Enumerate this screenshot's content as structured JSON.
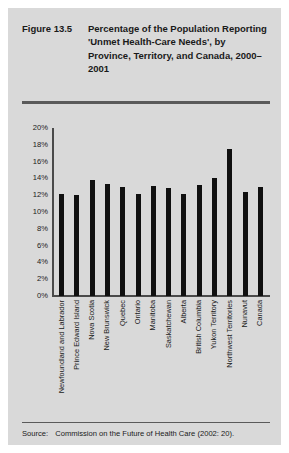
{
  "figure": {
    "number": "Figure 13.5",
    "title": "Percentage of the Population Reporting 'Unmet Health-Care Needs', by Province, Territory, and Canada, 2000–2001",
    "source_label": "Source:",
    "source_text": "Commission on the Future of Health Care (2002: 20)."
  },
  "colors": {
    "panel_background": "#d9d9d9",
    "bar": "#101010",
    "axis": "#4a4a4a",
    "rule": "#5a5a5a",
    "text": "#1a1a1a"
  },
  "chart_data": {
    "type": "bar",
    "title": "Percentage of the Population Reporting 'Unmet Health-Care Needs', by Province, Territory, and Canada, 2000–2001",
    "xlabel": "",
    "ylabel": "",
    "ylim": [
      0,
      20
    ],
    "ytick_labels": [
      "20%",
      "18%",
      "16%",
      "14%",
      "12%",
      "10%",
      "8%",
      "6%",
      "4%",
      "2%",
      "0%"
    ],
    "ytick_values": [
      20,
      18,
      16,
      14,
      12,
      10,
      8,
      6,
      4,
      2,
      0
    ],
    "grid": false,
    "legend": false,
    "categories": [
      "Newfoundland and Labrador",
      "Prince Edward Island",
      "Nova Scotia",
      "New Brunswick",
      "Quebec",
      "Ontario",
      "Manitoba",
      "Saskatchewan",
      "Alberta",
      "British Columbia",
      "Yukon Territory",
      "Northwest Territories",
      "Nunavut",
      "Canada"
    ],
    "values": [
      12.2,
      12.0,
      13.8,
      13.3,
      13.0,
      12.1,
      13.1,
      12.9,
      12.2,
      13.2,
      14.0,
      17.5,
      12.4,
      13.0
    ]
  }
}
